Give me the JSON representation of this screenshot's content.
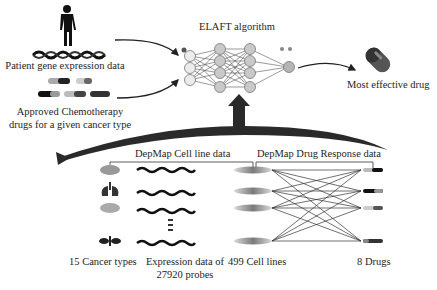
{
  "inputs": {
    "patient_label": "Patient gene expression data",
    "drugs_label_line1": "Approved Chemotherapy",
    "drugs_label_line2": "drugs for a given cancer type"
  },
  "algorithm": {
    "title": "ELAFT algorithm",
    "layers": [
      3,
      4,
      4,
      1
    ]
  },
  "output": {
    "label": "Most effective drug"
  },
  "training": {
    "cell_line_header": "DepMap Cell line data",
    "drug_response_header": "DepMap Drug Response data",
    "cancer_types_label": "15 Cancer types",
    "expression_label_line1": "Expression data of",
    "expression_label_line2": "27920 probes",
    "cell_lines_label": "499 Cell lines",
    "drugs_label": "8 Drugs"
  },
  "colors": {
    "arrow_dark": "#2a2a2a",
    "node_fill": "#c8c8c8",
    "node_light": "#e6e6e6",
    "line": "#333333"
  }
}
